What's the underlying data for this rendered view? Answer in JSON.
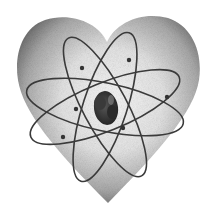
{
  "illustration": {
    "subject": "heart with atom symbol",
    "caption": "Atomic heart illustration",
    "colors": {
      "background": "#ffffff",
      "heart_light": "#f4f4f4",
      "heart_mid": "#b8b8b8",
      "heart_dark": "#5a5a5a",
      "orbit_stroke": "#3a3a3a",
      "nucleus": "#2e2e2e",
      "electron": "#333333"
    },
    "heart": {
      "notch": [
        107,
        40
      ],
      "tip": [
        108,
        203
      ],
      "left_extent": 17,
      "right_extent": 200,
      "top": 15
    },
    "atom": {
      "center": [
        105,
        107
      ],
      "orbits": [
        {
          "rx": 80,
          "ry": 24,
          "rotate": 12
        },
        {
          "rx": 80,
          "ry": 24,
          "rotate": -22
        },
        {
          "rx": 78,
          "ry": 22,
          "rotate": 62
        },
        {
          "rx": 78,
          "ry": 22,
          "rotate": -72
        }
      ],
      "electrons": [
        [
          129,
          60
        ],
        [
          82,
          68
        ],
        [
          167,
          97
        ],
        [
          76,
          109
        ],
        [
          123,
          128
        ],
        [
          63,
          137
        ]
      ]
    }
  }
}
